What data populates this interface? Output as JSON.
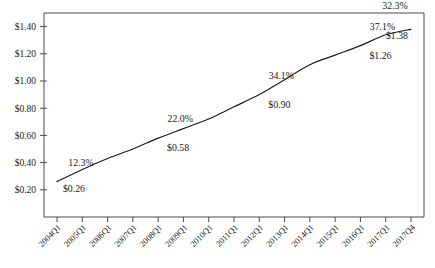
{
  "chart_data": {
    "type": "line",
    "title": "",
    "subtitle": "",
    "xlabel": "",
    "ylabel": "",
    "grid": false,
    "legend": "none",
    "ylim": [
      0.0,
      1.5
    ],
    "ytick_labels": [
      "$1.40",
      "$1.20",
      "$1.00",
      "$0.80",
      "$0.60",
      "$0.40",
      "$0.20"
    ],
    "ytick_values": [
      1.4,
      1.2,
      1.0,
      0.8,
      0.6,
      0.4,
      0.2
    ],
    "categories": [
      "2004Q1",
      "2005Q1",
      "2006Q1",
      "2007Q1",
      "2008Q1",
      "2009Q1",
      "2010Q1",
      "2011Q1",
      "2012Q1",
      "2013Q1",
      "2014Q1",
      "2015Q1",
      "2016Q1",
      "2017Q1",
      "2017Q4"
    ],
    "series": [
      {
        "name": "value",
        "values": [
          0.26,
          0.35,
          0.43,
          0.5,
          0.58,
          0.65,
          0.72,
          0.81,
          0.9,
          1.01,
          1.12,
          1.19,
          1.26,
          1.34,
          1.38
        ]
      }
    ],
    "annotations": [
      {
        "label_pct": "12.3%",
        "label_value": "$0.26",
        "category": "2004Q1",
        "value": 0.26
      },
      {
        "label_pct": "22.0%",
        "label_value": "$0.58",
        "category": "2008Q1",
        "value": 0.58
      },
      {
        "label_pct": "34.1%",
        "label_value": "$0.90",
        "category": "2012Q1",
        "value": 0.9
      },
      {
        "label_pct": "37.1%",
        "label_value": "$1.26",
        "category": "2016Q1",
        "value": 1.26
      },
      {
        "label_pct": "32.3%",
        "label_value": "$1.38",
        "category": "2017Q4",
        "value": 1.38
      }
    ]
  },
  "style": {
    "line_color": "#1a1a1a",
    "frame_color": "#4a4a4a",
    "text_color": "#1a1a1a",
    "background": "#ffffff"
  }
}
